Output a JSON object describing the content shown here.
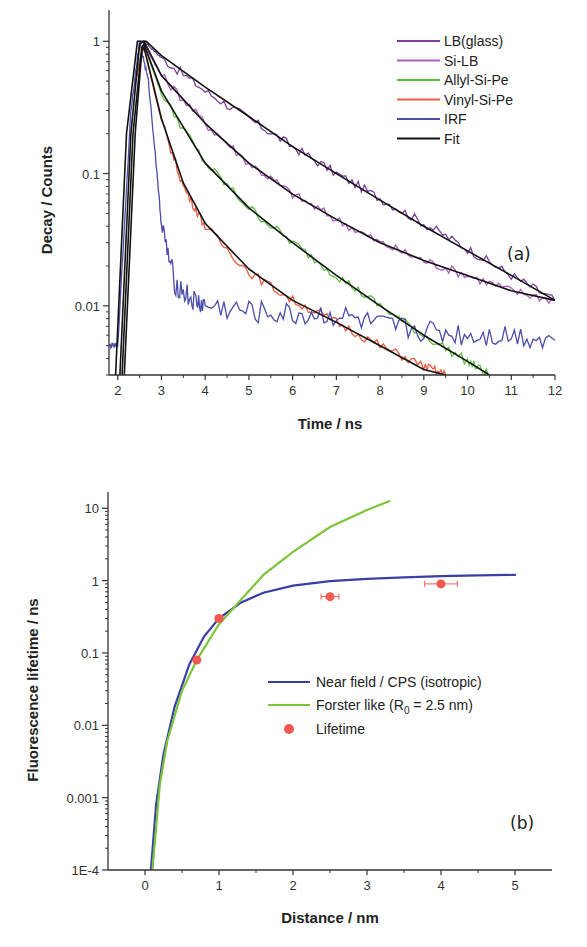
{
  "chart_data": [
    {
      "id": "a",
      "type": "line",
      "panel_label": "(a)",
      "title": "",
      "xlabel": "Time / ns",
      "ylabel": "Decay / Counts",
      "xscale": "linear",
      "yscale": "log",
      "xlim": [
        1.8,
        12
      ],
      "ylim": [
        0.003,
        1.5
      ],
      "xticks": [
        2,
        3,
        4,
        5,
        6,
        7,
        8,
        9,
        10,
        11,
        12
      ],
      "xtick_labels": [
        "2",
        "3",
        "4",
        "5",
        "6",
        "7",
        "8",
        "9",
        "10",
        "11",
        "12"
      ],
      "yticks": [
        1,
        0.1,
        0.01
      ],
      "ytick_labels": [
        "1",
        "0.1",
        "0.01"
      ],
      "grid": false,
      "legend_position": "upper right",
      "series": [
        {
          "name": "LB(glass)",
          "color": "#7b3f9e",
          "x": [
            2.4,
            2.6,
            3,
            4,
            5,
            6,
            7,
            8,
            9,
            10,
            11,
            12
          ],
          "y": [
            0.5,
            1.0,
            0.75,
            0.42,
            0.26,
            0.16,
            0.1,
            0.065,
            0.042,
            0.027,
            0.017,
            0.011
          ]
        },
        {
          "name": "Si-LB",
          "color": "#b05cc0",
          "x": [
            2.4,
            2.6,
            3,
            4,
            5,
            6,
            7,
            8,
            9,
            10,
            11,
            12
          ],
          "y": [
            0.5,
            0.95,
            0.55,
            0.24,
            0.12,
            0.07,
            0.045,
            0.03,
            0.022,
            0.017,
            0.013,
            0.011
          ]
        },
        {
          "name": "Allyl-Si-Pe",
          "color": "#5cc040",
          "x": [
            2.4,
            2.6,
            3,
            4,
            5,
            6,
            7,
            8,
            9,
            10,
            10.5
          ],
          "y": [
            0.5,
            0.95,
            0.4,
            0.12,
            0.055,
            0.03,
            0.017,
            0.01,
            0.006,
            0.0038,
            0.003
          ]
        },
        {
          "name": "Vinyl-Si-Pe",
          "color": "#f05a40",
          "x": [
            2.4,
            2.6,
            3,
            3.5,
            4,
            5,
            6,
            7,
            8,
            9,
            9.5
          ],
          "y": [
            0.5,
            0.9,
            0.25,
            0.08,
            0.04,
            0.018,
            0.011,
            0.0075,
            0.005,
            0.0035,
            0.003
          ]
        },
        {
          "name": "IRF",
          "color": "#4a4ea8",
          "x": [
            1.8,
            2.0,
            2.3,
            2.5,
            2.7,
            2.9,
            3.0,
            3.3,
            3.7,
            4,
            5,
            6,
            7,
            8,
            9,
            10,
            11,
            12
          ],
          "y": [
            0.005,
            0.005,
            0.3,
            1.0,
            0.5,
            0.1,
            0.04,
            0.015,
            0.011,
            0.01,
            0.009,
            0.0085,
            0.0085,
            0.007,
            0.0065,
            0.006,
            0.006,
            0.0055
          ]
        },
        {
          "name": "Fit",
          "color": "#111111",
          "x": [],
          "y": []
        }
      ],
      "fits": [
        {
          "x": [
            1.95,
            2.2,
            2.45,
            2.65,
            3,
            4,
            5,
            6,
            7,
            8,
            9,
            10,
            11,
            12
          ],
          "y": [
            0.003,
            0.2,
            1.0,
            1.0,
            0.78,
            0.45,
            0.27,
            0.16,
            0.1,
            0.063,
            0.04,
            0.026,
            0.017,
            0.011
          ]
        },
        {
          "x": [
            2.05,
            2.3,
            2.5,
            2.6,
            3,
            4,
            5,
            6,
            7,
            8,
            9,
            10,
            11,
            12
          ],
          "y": [
            0.003,
            0.2,
            0.95,
            1.0,
            0.55,
            0.24,
            0.12,
            0.07,
            0.045,
            0.03,
            0.022,
            0.017,
            0.013,
            0.011
          ]
        },
        {
          "x": [
            2.1,
            2.35,
            2.55,
            2.6,
            3,
            4,
            5,
            6,
            7,
            8,
            9,
            10,
            10.5
          ],
          "y": [
            0.003,
            0.2,
            0.9,
            0.95,
            0.42,
            0.12,
            0.055,
            0.03,
            0.017,
            0.01,
            0.006,
            0.0038,
            0.003
          ]
        },
        {
          "x": [
            2.15,
            2.4,
            2.55,
            2.6,
            3,
            3.5,
            4,
            5,
            6,
            7,
            8,
            9,
            9.5
          ],
          "y": [
            0.003,
            0.2,
            0.85,
            0.9,
            0.26,
            0.085,
            0.042,
            0.019,
            0.011,
            0.0075,
            0.005,
            0.0033,
            0.003
          ]
        }
      ]
    },
    {
      "id": "b",
      "type": "line",
      "panel_label": "(b)",
      "title": "",
      "xlabel": "Distance / nm",
      "ylabel": "Fluorescence lifetime / ns",
      "xscale": "linear",
      "yscale": "log",
      "xlim": [
        -0.5,
        5.5
      ],
      "ylim": [
        0.0001,
        13
      ],
      "xticks": [
        0,
        1,
        2,
        3,
        4,
        5
      ],
      "xtick_labels": [
        "0",
        "1",
        "2",
        "3",
        "4",
        "5"
      ],
      "yticks": [
        10,
        1,
        0.1,
        0.01,
        0.001,
        0.0001
      ],
      "ytick_labels": [
        "10",
        "1",
        "0.1",
        "0.01",
        "0.001",
        "1E-4"
      ],
      "grid": false,
      "legend_position": "center right",
      "series": [
        {
          "name": "Near field / CPS (isotropic)",
          "color": "#3a3fa8",
          "kind": "line",
          "x": [
            0.08,
            0.15,
            0.25,
            0.4,
            0.6,
            0.8,
            1.0,
            1.3,
            1.6,
            2.0,
            2.5,
            3.0,
            3.5,
            4.0,
            4.5,
            5.0
          ],
          "y": [
            0.0001,
            0.0008,
            0.004,
            0.018,
            0.07,
            0.17,
            0.3,
            0.5,
            0.68,
            0.85,
            0.98,
            1.06,
            1.11,
            1.15,
            1.18,
            1.2
          ]
        },
        {
          "name": "Forster like (R₀ = 2.5 nm)",
          "name_main": "Forster like (R",
          "name_sub": "0",
          "name_tail": " = 2.5 nm)",
          "color": "#7cc43a",
          "kind": "line",
          "x": [
            0.1,
            0.2,
            0.3,
            0.5,
            0.7,
            1.0,
            1.3,
            1.6,
            2.0,
            2.5,
            3.0,
            3.3
          ],
          "y": [
            0.0001,
            0.0015,
            0.006,
            0.03,
            0.08,
            0.25,
            0.55,
            1.2,
            2.5,
            5.5,
            9.5,
            12.5
          ]
        },
        {
          "name": "Lifetime",
          "color": "#f25a50",
          "kind": "scatter",
          "x": [
            0.7,
            1.0,
            2.5,
            4.0
          ],
          "y": [
            0.08,
            0.3,
            0.6,
            0.9
          ],
          "xerr": [
            0.03,
            0.05,
            0.12,
            0.22
          ]
        }
      ]
    }
  ],
  "legend_a": [
    "LB(glass)",
    "Si-LB",
    "Allyl-Si-Pe",
    "Vinyl-Si-Pe",
    "IRF",
    "Fit"
  ],
  "legend_b": {
    "near_field": "Near field / CPS (isotropic)",
    "forster_main": "Forster like (R",
    "forster_sub": "0",
    "forster_tail": " = 2.5 nm)",
    "lifetime": "Lifetime"
  }
}
